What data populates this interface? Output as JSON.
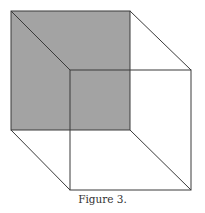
{
  "figure": {
    "caption": "Figure 3.",
    "shape": "necker-cube",
    "shaded_face": "back",
    "colors": {
      "shade": "#a3a3a3",
      "stroke": "#3a3a3a",
      "background": "#ffffff"
    },
    "back_square": {
      "x": 11,
      "y": 11,
      "size": 119
    },
    "front_square": {
      "x": 70,
      "y": 70,
      "size": 121
    }
  }
}
